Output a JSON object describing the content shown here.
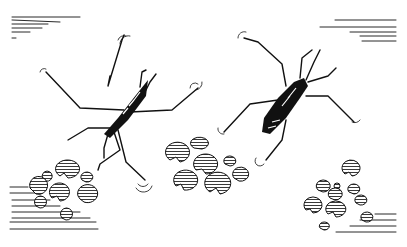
{
  "illustration": {
    "subject": "two water striders on water with lily pads",
    "style": "black ink line drawing",
    "colors": {
      "ink": "#111111",
      "paper": "#ffffff"
    },
    "insects": [
      {
        "name": "water-strider-left",
        "center": [
          122,
          112
        ]
      },
      {
        "name": "water-strider-right",
        "center": [
          290,
          95
        ]
      }
    ],
    "lily_pad_clusters": [
      {
        "name": "lily-pads-left",
        "region": [
          20,
          165,
          100,
          225
        ]
      },
      {
        "name": "lily-pads-center",
        "region": [
          165,
          145,
          255,
          210
        ]
      },
      {
        "name": "lily-pads-right",
        "region": [
          300,
          165,
          375,
          230
        ]
      }
    ],
    "water_lines": [
      {
        "name": "water-lines-top-left"
      },
      {
        "name": "water-lines-top-right"
      },
      {
        "name": "water-lines-bottom-left"
      },
      {
        "name": "water-lines-bottom-right"
      }
    ]
  }
}
